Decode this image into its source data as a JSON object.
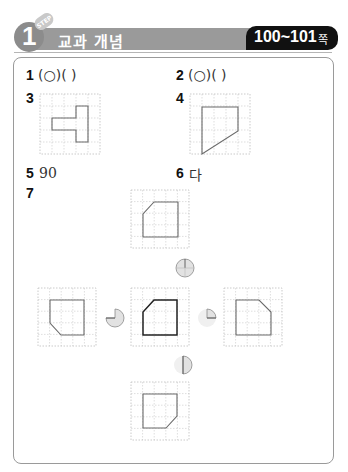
{
  "header": {
    "step_number": "1",
    "step_tag": "STEP",
    "title": "교과 개념",
    "page_range": "100~101",
    "page_unit": "쪽"
  },
  "questions": [
    {
      "num": "1",
      "answer": "(○)(   )"
    },
    {
      "num": "2",
      "answer": "(○)(   )"
    },
    {
      "num": "3",
      "answer_type": "drawing",
      "shape": "T-shape on 5x5 grid"
    },
    {
      "num": "4",
      "answer_type": "drawing",
      "shape": "trapezoid on 5x5 grid"
    },
    {
      "num": "5",
      "answer": "90"
    },
    {
      "num": "6",
      "answer": "다"
    },
    {
      "num": "7",
      "answer_type": "rotation-diagram",
      "center": "pentagon with cut top-left corner",
      "rotations": [
        "top: 360° (full turn)",
        "left: 270°",
        "right: 90°",
        "bottom: 180°"
      ]
    }
  ],
  "colors": {
    "header_bar": "#9a9a9a",
    "page_badge": "#111111",
    "panel_border": "#9a9a9a",
    "grid": "#c8c8c8",
    "shape": "#6a6a6a"
  }
}
